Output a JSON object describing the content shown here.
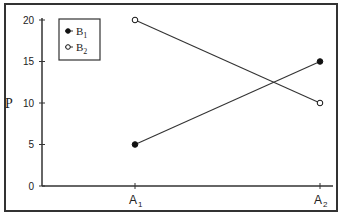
{
  "chart_data": {
    "type": "line",
    "title": "",
    "xlabel": "",
    "ylabel": "P",
    "ylim": [
      0,
      20
    ],
    "yticks": [
      0,
      5,
      10,
      15,
      20
    ],
    "categories": [
      {
        "base": "A",
        "sub": "1"
      },
      {
        "base": "A",
        "sub": "2"
      }
    ],
    "series": [
      {
        "name": "B",
        "sub": "1",
        "marker": "filled-circle",
        "values": [
          5,
          15
        ]
      },
      {
        "name": "B",
        "sub": "2",
        "marker": "open-circle",
        "values": [
          20,
          10
        ]
      }
    ],
    "legend": {
      "position": "top-left"
    },
    "grid": false
  }
}
